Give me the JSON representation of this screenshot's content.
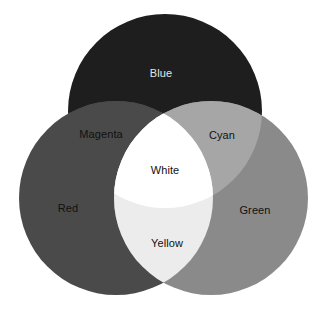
{
  "diagram": {
    "type": "venn",
    "canvas": {
      "width": 322,
      "height": 310,
      "background": "#ffffff"
    },
    "circles": [
      {
        "id": "blue",
        "label": "Blue",
        "cx": 165,
        "cy": 111,
        "r": 97,
        "fill": "#1e1e1e"
      },
      {
        "id": "red",
        "label": "Red",
        "cx": 116,
        "cy": 198,
        "r": 97,
        "fill": "#4a4a4a"
      },
      {
        "id": "green",
        "label": "Green",
        "cx": 211,
        "cy": 198,
        "r": 97,
        "fill": "#8a8a8a"
      }
    ],
    "regions": {
      "blue_only": {
        "label": "Blue",
        "fill": "#1e1e1e",
        "text_color": "#e6e6e6",
        "x": 161,
        "y": 73
      },
      "red_only": {
        "label": "Red",
        "fill": "#4a4a4a",
        "text_color": "#111111",
        "x": 68,
        "y": 208
      },
      "green_only": {
        "label": "Green",
        "fill": "#8a8a8a",
        "text_color": "#111111",
        "x": 255,
        "y": 210
      },
      "magenta": {
        "label": "Magenta",
        "sets": [
          "red",
          "blue"
        ],
        "fill": "#4a4a4a",
        "text_color": "#111111",
        "x": 101,
        "y": 134
      },
      "cyan": {
        "label": "Cyan",
        "sets": [
          "green",
          "blue"
        ],
        "fill": "#a6a6a6",
        "text_color": "#111111",
        "x": 222,
        "y": 135
      },
      "yellow": {
        "label": "Yellow",
        "sets": [
          "red",
          "green"
        ],
        "fill": "#ececec",
        "text_color": "#111111",
        "x": 167,
        "y": 243
      },
      "white": {
        "label": "White",
        "sets": [
          "red",
          "green",
          "blue"
        ],
        "fill": "#ffffff",
        "text_color": "#111111",
        "x": 165,
        "y": 170
      }
    }
  }
}
